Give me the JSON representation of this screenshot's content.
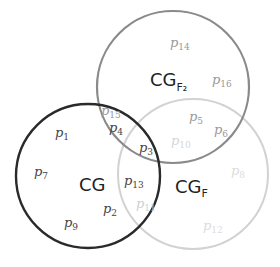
{
  "diagram": {
    "type": "venn",
    "sets": [
      {
        "id": "CG",
        "name": "CG",
        "subscript": "",
        "color": "#2a2a2a"
      },
      {
        "id": "CGF2",
        "name": "CG",
        "subscript": "F₂",
        "color": "#8a8a8a"
      },
      {
        "id": "CGF",
        "name": "CG",
        "subscript": "F",
        "color": "#d2d2d2"
      }
    ],
    "elements": [
      {
        "base": "p",
        "sub": "1",
        "region": "CG only",
        "color": "#444444"
      },
      {
        "base": "p",
        "sub": "7",
        "region": "CG only",
        "color": "#444444"
      },
      {
        "base": "p",
        "sub": "9",
        "region": "CG only",
        "color": "#444444"
      },
      {
        "base": "p",
        "sub": "2",
        "region": "CG only",
        "color": "#444444"
      },
      {
        "base": "p",
        "sub": "15",
        "region": "CG ∩ CGF2",
        "color": "#9a9a9a"
      },
      {
        "base": "p",
        "sub": "4",
        "region": "CG ∩ CGF2",
        "color": "#444444"
      },
      {
        "base": "p",
        "sub": "3",
        "region": "CG ∩ CGF2 ∩ CGF",
        "color": "#444444"
      },
      {
        "base": "p",
        "sub": "13",
        "region": "CG ∩ CGF",
        "color": "#444444"
      },
      {
        "base": "p",
        "sub": "11",
        "region": "CG ∩ CGF",
        "color": "#d0d0d0"
      },
      {
        "base": "p",
        "sub": "14",
        "region": "CGF2 only",
        "color": "#9a9a9a"
      },
      {
        "base": "p",
        "sub": "16",
        "region": "CGF2 only",
        "color": "#9a9a9a"
      },
      {
        "base": "p",
        "sub": "5",
        "region": "CGF2 ∩ CGF",
        "color": "#9a9a9a"
      },
      {
        "base": "p",
        "sub": "6",
        "region": "CGF2 ∩ CGF",
        "color": "#9a9a9a"
      },
      {
        "base": "p",
        "sub": "10",
        "region": "CGF2 ∩ CGF",
        "color": "#d6d6d6"
      },
      {
        "base": "p",
        "sub": "8",
        "region": "CGF only",
        "color": "#dcdcdc"
      },
      {
        "base": "p",
        "sub": "12",
        "region": "CGF only",
        "color": "#dcdcdc"
      }
    ]
  }
}
